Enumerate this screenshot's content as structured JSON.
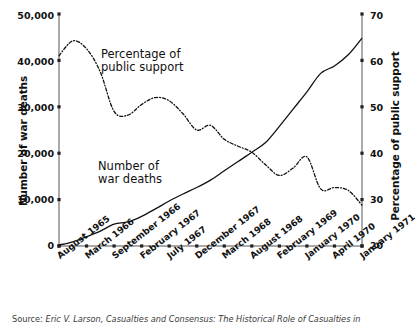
{
  "chart_data": {
    "type": "line",
    "title": "",
    "xlabel": "",
    "categories": [
      "August 1965",
      "March 1966",
      "September 1966",
      "February 1967",
      "July 1967",
      "December 1967",
      "March 1968",
      "August 1968",
      "February 1969",
      "January 1970",
      "April 1970",
      "January 1971"
    ],
    "grid": false,
    "legend_position": "inline-annotation",
    "axes": {
      "left": {
        "label": "Number of war deaths",
        "ylim": [
          0,
          50000
        ],
        "ticks": [
          0,
          10000,
          20000,
          30000,
          40000,
          50000
        ],
        "ticklabels": [
          "0",
          "10,000",
          "20,000",
          "30,000",
          "40,000",
          "50,000"
        ]
      },
      "right": {
        "label": "Percentage of public support",
        "ylim": [
          20,
          70
        ],
        "ticks": [
          20,
          30,
          40,
          50,
          60,
          70
        ],
        "ticklabels": [
          "20",
          "30",
          "40",
          "50",
          "60",
          "70"
        ]
      }
    },
    "series": [
      {
        "name": "Number of war deaths",
        "axis": "left",
        "style": "solid",
        "annotation": "Number of\nwar deaths",
        "x": [
          0,
          0.5,
          1,
          1.5,
          2,
          2.5,
          3,
          3.5,
          4,
          4.5,
          5,
          5.5,
          6,
          6.5,
          7,
          7.5,
          8,
          8.5,
          9,
          9.5,
          10,
          10.5,
          11
        ],
        "values": [
          200,
          900,
          2000,
          3200,
          4700,
          5200,
          6400,
          8000,
          9700,
          11200,
          12600,
          14200,
          16200,
          18200,
          20200,
          22300,
          25800,
          29500,
          33200,
          37200,
          38800,
          41200,
          44800
        ]
      },
      {
        "name": "Percentage of public support",
        "axis": "right",
        "style": "dash-dot",
        "annotation": "Percentage of\npublic support",
        "x": [
          0,
          0.5,
          1,
          1.5,
          2,
          2.5,
          3,
          3.5,
          4,
          4.5,
          5,
          5.5,
          6,
          6.5,
          7,
          7.5,
          8,
          8.5,
          9,
          9.5,
          10,
          10.5,
          11
        ],
        "values": [
          61.0,
          64.2,
          62.5,
          57.5,
          49.0,
          48.2,
          50.5,
          52.0,
          51.3,
          48.5,
          45.0,
          46.0,
          43.0,
          41.5,
          40.2,
          37.5,
          35.2,
          36.8,
          39.2,
          32.3,
          32.6,
          32.0,
          28.8
        ]
      }
    ],
    "intersection_note": "Series cross near March 1968 at ~20,000 deaths / ~41% support"
  },
  "annotations": {
    "support_note": "Percentage of\npublic support",
    "deaths_note": "Number of\nwar deaths"
  },
  "caption": {
    "lead": "Source:",
    "text": "Eric V. Larson, Casualties and Consensus: The Historical Role of Casualties in"
  }
}
